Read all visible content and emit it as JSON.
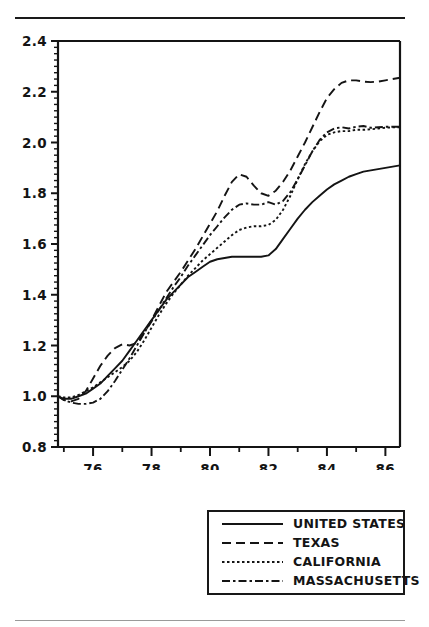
{
  "figure": {
    "top_rule": true,
    "bottom_rule": true
  },
  "chart_data": {
    "type": "line",
    "title": "",
    "subtitle": "",
    "xlabel": "",
    "ylabel": "",
    "xlim": [
      74.8,
      86.5
    ],
    "ylim": [
      0.8,
      2.4
    ],
    "grid": false,
    "legend_position": "bottom-right",
    "y_ticks": [
      "0.8",
      "1.0",
      "1.2",
      "1.4",
      "1.6",
      "1.8",
      "2.0",
      "2.2",
      "2.4"
    ],
    "y_tick_values": [
      0.8,
      1.0,
      1.2,
      1.4,
      1.6,
      1.8,
      2.0,
      2.2,
      2.4
    ],
    "y_minor_step": 0.025,
    "x_ticks": [
      "76",
      "78",
      "80",
      "82",
      "84",
      "86"
    ],
    "x_tick_values": [
      76,
      78,
      80,
      82,
      84,
      86
    ],
    "x_minor_values": [
      75,
      77,
      79,
      81,
      83,
      85
    ],
    "x": [
      74.8,
      75.0,
      75.25,
      75.5,
      75.75,
      76.0,
      76.25,
      76.5,
      76.75,
      77.0,
      77.25,
      77.5,
      77.75,
      78.0,
      78.25,
      78.5,
      78.75,
      79.0,
      79.25,
      79.5,
      79.75,
      80.0,
      80.25,
      80.5,
      80.75,
      81.0,
      81.25,
      81.5,
      81.75,
      82.0,
      82.25,
      82.5,
      82.75,
      83.0,
      83.25,
      83.5,
      83.75,
      84.0,
      84.25,
      84.5,
      84.75,
      85.0,
      85.25,
      85.5,
      85.75,
      86.0,
      86.25,
      86.5
    ],
    "series": [
      {
        "name": "UNITED STATES",
        "style": "solid",
        "values": [
          1.0,
          0.99,
          0.99,
          1.0,
          1.01,
          1.03,
          1.05,
          1.08,
          1.11,
          1.14,
          1.18,
          1.22,
          1.26,
          1.3,
          1.34,
          1.38,
          1.41,
          1.44,
          1.47,
          1.49,
          1.51,
          1.53,
          1.54,
          1.545,
          1.55,
          1.55,
          1.55,
          1.55,
          1.55,
          1.555,
          1.58,
          1.62,
          1.66,
          1.7,
          1.735,
          1.765,
          1.79,
          1.815,
          1.835,
          1.85,
          1.865,
          1.875,
          1.885,
          1.89,
          1.895,
          1.9,
          1.905,
          1.91
        ]
      },
      {
        "name": "TEXAS",
        "style": "dashed",
        "values": [
          1.0,
          0.985,
          0.98,
          0.99,
          1.02,
          1.07,
          1.12,
          1.16,
          1.19,
          1.205,
          1.2,
          1.21,
          1.25,
          1.3,
          1.355,
          1.41,
          1.45,
          1.49,
          1.535,
          1.58,
          1.63,
          1.68,
          1.73,
          1.79,
          1.845,
          1.875,
          1.865,
          1.83,
          1.8,
          1.79,
          1.81,
          1.845,
          1.89,
          1.945,
          2.0,
          2.06,
          2.12,
          2.175,
          2.21,
          2.235,
          2.245,
          2.245,
          2.24,
          2.238,
          2.24,
          2.245,
          2.25,
          2.255
        ]
      },
      {
        "name": "CALIFORNIA",
        "style": "dotted",
        "values": [
          1.0,
          0.995,
          0.995,
          1.005,
          1.02,
          1.035,
          1.055,
          1.075,
          1.095,
          1.115,
          1.14,
          1.175,
          1.22,
          1.27,
          1.32,
          1.365,
          1.405,
          1.44,
          1.475,
          1.505,
          1.535,
          1.56,
          1.585,
          1.61,
          1.635,
          1.655,
          1.665,
          1.67,
          1.67,
          1.675,
          1.695,
          1.735,
          1.79,
          1.855,
          1.915,
          1.965,
          2.005,
          2.03,
          2.04,
          2.045,
          2.045,
          2.05,
          2.05,
          2.052,
          2.055,
          2.058,
          2.06,
          2.06
        ]
      },
      {
        "name": "MASSACHUSETTS",
        "style": "dashdot",
        "values": [
          1.0,
          0.985,
          0.975,
          0.97,
          0.97,
          0.975,
          0.99,
          1.02,
          1.06,
          1.105,
          1.15,
          1.2,
          1.25,
          1.295,
          1.34,
          1.385,
          1.43,
          1.47,
          1.515,
          1.555,
          1.595,
          1.635,
          1.67,
          1.705,
          1.735,
          1.755,
          1.76,
          1.755,
          1.755,
          1.765,
          1.755,
          1.77,
          1.805,
          1.855,
          1.91,
          1.965,
          2.01,
          2.04,
          2.055,
          2.06,
          2.055,
          2.062,
          2.065,
          2.058,
          2.06,
          2.062,
          2.062,
          2.062
        ]
      }
    ]
  },
  "legend": {
    "items": [
      {
        "label": "UNITED STATES",
        "style": "solid"
      },
      {
        "label": "TEXAS",
        "style": "dashed"
      },
      {
        "label": "CALIFORNIA",
        "style": "dotted"
      },
      {
        "label": "MASSACHUSETTS",
        "style": "dashdot"
      }
    ]
  },
  "colors": {
    "ink": "#141414",
    "background": "#ffffff"
  }
}
